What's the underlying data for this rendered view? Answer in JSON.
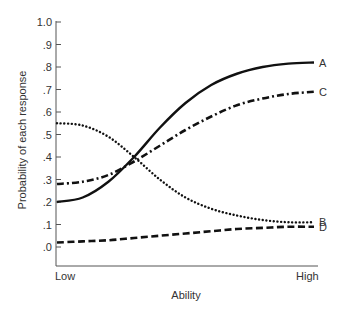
{
  "chart_data": {
    "type": "line",
    "title": "",
    "xlabel": "Ability",
    "ylabel": "Probability of each response",
    "x_tick_labels": [
      "Low",
      "High"
    ],
    "y_ticks": [
      0.0,
      0.1,
      0.2,
      0.3,
      0.4,
      0.5,
      0.6,
      0.7,
      0.8,
      0.9,
      1.0
    ],
    "y_tick_labels": [
      ".0",
      ".1",
      ".2",
      ".3",
      ".4",
      ".5",
      ".6",
      ".7",
      ".8",
      ".9",
      "1.0"
    ],
    "ylim": [
      -0.09,
      1.0
    ],
    "xlim": [
      0,
      1
    ],
    "grid": false,
    "legend": "inline labels at right end of each curve",
    "x": [
      0.0,
      0.1,
      0.2,
      0.3,
      0.4,
      0.5,
      0.6,
      0.7,
      0.8,
      0.9,
      1.0
    ],
    "series": [
      {
        "name": "A",
        "style": "solid",
        "values": [
          0.2,
          0.22,
          0.29,
          0.4,
          0.53,
          0.64,
          0.72,
          0.77,
          0.8,
          0.815,
          0.82
        ]
      },
      {
        "name": "B",
        "style": "dotted",
        "values": [
          0.55,
          0.54,
          0.49,
          0.4,
          0.3,
          0.22,
          0.17,
          0.14,
          0.12,
          0.11,
          0.11
        ]
      },
      {
        "name": "C",
        "style": "dashdot",
        "values": [
          0.28,
          0.29,
          0.32,
          0.38,
          0.45,
          0.52,
          0.58,
          0.63,
          0.66,
          0.68,
          0.69
        ]
      },
      {
        "name": "D",
        "style": "dashed",
        "values": [
          0.02,
          0.025,
          0.03,
          0.04,
          0.05,
          0.06,
          0.07,
          0.08,
          0.085,
          0.09,
          0.09
        ]
      }
    ]
  },
  "labels": {
    "ylabel": "Probability of each response",
    "xlabel": "Ability",
    "x_low": "Low",
    "x_high": "High"
  }
}
